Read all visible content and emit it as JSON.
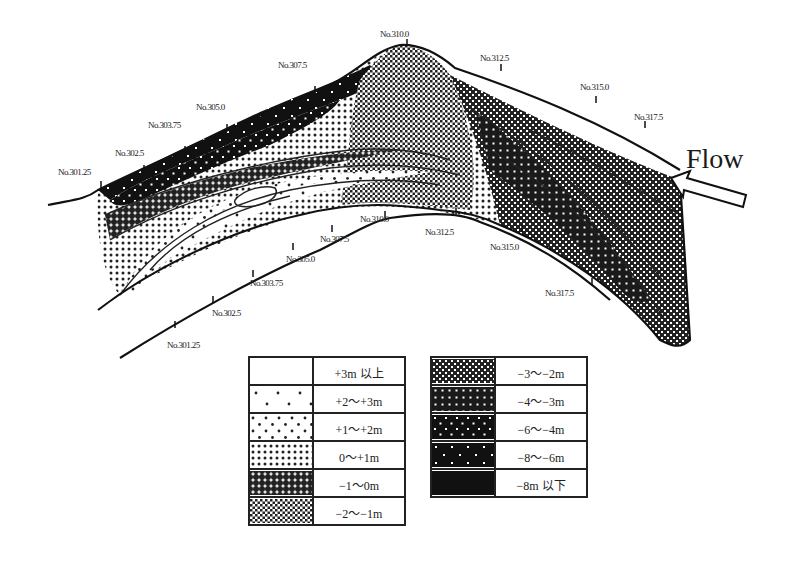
{
  "diagram": {
    "flow": {
      "label": "Flow",
      "icon": "arrow-left-outline-icon"
    },
    "outer_bank_stations": [
      {
        "label": "No.301.25",
        "x": 58,
        "y": 175
      },
      {
        "label": "No.302.5",
        "x": 115,
        "y": 156
      },
      {
        "label": "No.303.75",
        "x": 148,
        "y": 128
      },
      {
        "label": "No.305.0",
        "x": 196,
        "y": 110
      },
      {
        "label": "No.307.5",
        "x": 278,
        "y": 68
      },
      {
        "label": "No.310.0",
        "x": 380,
        "y": 37
      },
      {
        "label": "No.312.5",
        "x": 480,
        "y": 61
      },
      {
        "label": "No.315.0",
        "x": 580,
        "y": 90
      },
      {
        "label": "No.317.5",
        "x": 634,
        "y": 120
      }
    ],
    "inner_bank_stations": [
      {
        "label": "No.301.25",
        "x": 167,
        "y": 348
      },
      {
        "label": "No.302.5",
        "x": 212,
        "y": 316
      },
      {
        "label": "No.303.75",
        "x": 250,
        "y": 286
      },
      {
        "label": "No.305.0",
        "x": 286,
        "y": 262
      },
      {
        "label": "No.307.5",
        "x": 320,
        "y": 242
      },
      {
        "label": "No.310.0",
        "x": 360,
        "y": 222
      },
      {
        "label": "No.312.5",
        "x": 425,
        "y": 235
      },
      {
        "label": "No.315.0",
        "x": 490,
        "y": 250
      },
      {
        "label": "No.317.5",
        "x": 545,
        "y": 296
      }
    ]
  },
  "legend": {
    "left": [
      {
        "pattern": "white",
        "label": "+3m 以上"
      },
      {
        "pattern": "sparse-dots",
        "label": "+2～+3m"
      },
      {
        "pattern": "light-dots",
        "label": "+1～+2m"
      },
      {
        "pattern": "medium-dots",
        "label": "0～+1m"
      },
      {
        "pattern": "dense-dots",
        "label": "−1～0m"
      },
      {
        "pattern": "checker",
        "label": "−2～−1m"
      }
    ],
    "right": [
      {
        "pattern": "dark-checker",
        "label": "−3～−2m"
      },
      {
        "pattern": "dark-grid-dots",
        "label": "−4～−3m"
      },
      {
        "pattern": "dark-dots",
        "label": "−6～−4m"
      },
      {
        "pattern": "dark-sparse-dots",
        "label": "−8～−6m"
      },
      {
        "pattern": "black",
        "label": "−8m 以下"
      }
    ]
  }
}
